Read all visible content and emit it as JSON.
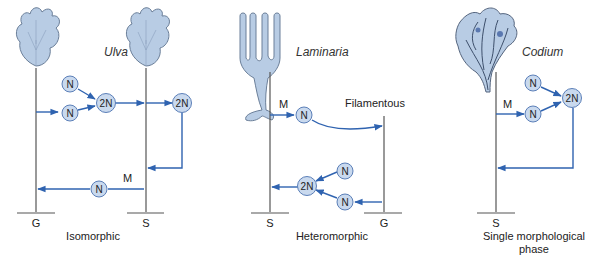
{
  "colors": {
    "arrow": "#2f63b0",
    "node_fill": "#c9d9ee",
    "node_stroke": "#5b7fb8",
    "stem": "#555555",
    "thallus_fill": "#b8cce4"
  },
  "panels": [
    {
      "species": "Ulva",
      "caption": "Isomorphic",
      "base_labels": [
        "G",
        "S"
      ],
      "meiosis_label": "M",
      "nodes": [
        "N",
        "N",
        "2N",
        "2N",
        "N"
      ]
    },
    {
      "species": "Laminaria",
      "caption": "Heteromorphic",
      "base_labels": [
        "S",
        "G"
      ],
      "meiosis_label": "M",
      "phase_label": "Filamentous",
      "nodes": [
        "N",
        "N",
        "N",
        "2N"
      ]
    },
    {
      "species": "Codium",
      "caption_line1": "Single morphological",
      "caption_line2": "phase",
      "base_labels": [
        "S"
      ],
      "meiosis_label": "M",
      "nodes": [
        "N",
        "N",
        "2N"
      ]
    }
  ]
}
